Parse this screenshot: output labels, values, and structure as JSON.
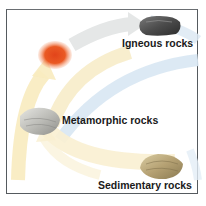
{
  "diagram": {
    "type": "rock-cycle",
    "nodes": [
      {
        "id": "magma",
        "label": "",
        "color": "#e8501f"
      },
      {
        "id": "igneous",
        "label": "Igneous rocks",
        "color": "#4a4a4a"
      },
      {
        "id": "metamorphic",
        "label": "Metamorphic rocks",
        "color": "#b8b8b4"
      },
      {
        "id": "sedimentary",
        "label": "Sedimentary rocks",
        "color": "#b8a57a"
      }
    ],
    "arrow_colors": {
      "yellow": "#f6e7b8",
      "gray": "#e4e6e6",
      "blue": "#d6e6f2"
    }
  },
  "labels": {
    "igneous": "Igneous rocks",
    "metamorphic": "Metamorphic rocks",
    "sedimentary": "Sedimentary rocks"
  }
}
